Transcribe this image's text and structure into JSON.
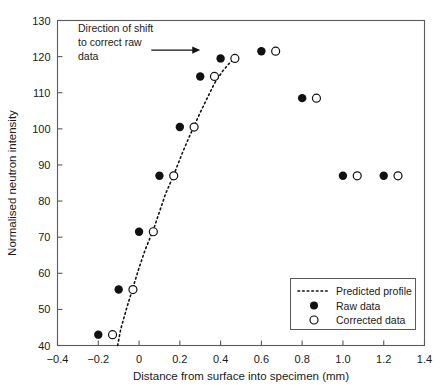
{
  "chart_data": {
    "type": "scatter",
    "title": "",
    "xlabel": "Distance from surface into specimen (mm)",
    "ylabel": "Normalised neutron intensity",
    "xlim": [
      -0.4,
      1.4
    ],
    "ylim": [
      40,
      130
    ],
    "xticks": [
      "-0.4",
      "-0.2",
      "0",
      "0.2",
      "0.4",
      "0.6",
      "0.8",
      "1.0",
      "1.2",
      "1.4"
    ],
    "xtick_values": [
      -0.4,
      -0.2,
      0,
      0.2,
      0.4,
      0.6,
      0.8,
      1.0,
      1.2,
      1.4
    ],
    "yticks": [
      "40",
      "50",
      "60",
      "70",
      "80",
      "90",
      "100",
      "110",
      "120",
      "130"
    ],
    "ytick_values": [
      40,
      50,
      60,
      70,
      80,
      90,
      100,
      110,
      120,
      130
    ],
    "grid": false,
    "legend_position": "lower right",
    "series": [
      {
        "name": "Predicted profile",
        "type": "line",
        "style": "dotted",
        "color": "#111111",
        "x": [
          -0.105,
          -0.09,
          -0.06,
          -0.03,
          0.0,
          0.03,
          0.07,
          0.1,
          0.13,
          0.17,
          0.21,
          0.24,
          0.27,
          0.3,
          0.33,
          0.37,
          0.41,
          0.45,
          0.48
        ],
        "y": [
          40.0,
          44.5,
          50.5,
          56.0,
          61.5,
          66.5,
          72.0,
          77.0,
          82.0,
          87.2,
          93.0,
          97.0,
          100.8,
          104.5,
          108.0,
          112.6,
          116.0,
          118.6,
          119.8
        ]
      },
      {
        "name": "Raw data",
        "type": "scatter",
        "marker": "filled-circle",
        "color": "#111111",
        "x": [
          -0.2,
          -0.1,
          0.0,
          0.1,
          0.2,
          0.3,
          0.4,
          0.6,
          0.8,
          1.0,
          1.2
        ],
        "y": [
          43.0,
          55.5,
          71.5,
          87.0,
          100.5,
          114.5,
          119.5,
          121.5,
          108.5,
          87.0,
          87.0
        ]
      },
      {
        "name": "Corrected data",
        "type": "scatter",
        "marker": "open-circle",
        "color": "#111111",
        "x": [
          -0.13,
          -0.03,
          0.07,
          0.17,
          0.27,
          0.37,
          0.47,
          0.67,
          0.87,
          1.07,
          1.27
        ],
        "y": [
          43.0,
          55.5,
          71.5,
          87.0,
          100.5,
          114.5,
          119.5,
          121.5,
          108.5,
          87.0,
          87.0
        ]
      }
    ],
    "annotations": [
      {
        "name": "shift-direction-note",
        "lines": [
          "Direction of shift",
          "to correct raw",
          "data"
        ],
        "arrow": {
          "x_start": 0.06,
          "x_end": 0.3,
          "y": 121.8
        }
      }
    ],
    "legend_entries": [
      {
        "label": "Predicted profile",
        "marker": "dotted-line"
      },
      {
        "label": "Raw data",
        "marker": "filled-circle"
      },
      {
        "label": "Corrected data",
        "marker": "open-circle"
      }
    ]
  }
}
